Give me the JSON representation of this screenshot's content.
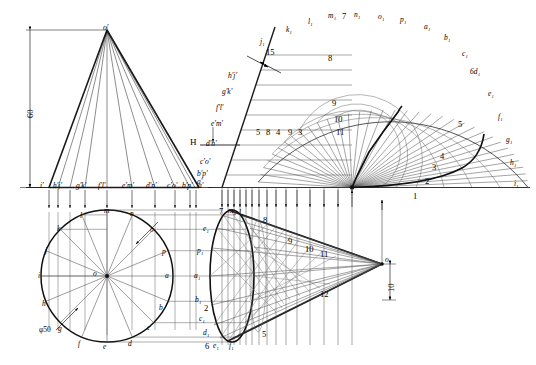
{
  "drawing": {
    "title": "Oblique cone surface development",
    "dimensions": {
      "height_60": "60",
      "diameter_50": "φ50",
      "offset_15": "15",
      "offset_10": "10"
    },
    "plane_label": "H",
    "front_view": {
      "apex": "o'",
      "base_labels": [
        "i'",
        "h'j'",
        "g'k'",
        "f'l'",
        "e'm'",
        "d'n'",
        "c'o'",
        "b'p'",
        "a'"
      ]
    },
    "plan_view": {
      "center": "o",
      "points": [
        "a",
        "b",
        "c",
        "d",
        "e",
        "f",
        "g",
        "h",
        "i",
        "j",
        "k",
        "l",
        "m",
        "n",
        "o",
        "p"
      ]
    },
    "aux_view": {
      "labels": [
        "h'j'",
        "g'k'",
        "f'l'",
        "e'm'",
        "d'n'",
        "c'o'",
        "b'p'",
        "a'"
      ],
      "center_numbers": [
        "5",
        "8",
        "4",
        "9",
        "3"
      ]
    },
    "development": {
      "apex": "o",
      "outer_labels": [
        "j₁",
        "k₁",
        "l₁",
        "m₁",
        "n₁",
        "o₁",
        "p₁",
        "a₁",
        "b₁",
        "c₁",
        "6d₁",
        "e₁",
        "f₁",
        "g₁",
        "h₁",
        "i₁"
      ],
      "inner_numbers": [
        "7",
        "8",
        "9",
        "10",
        "11",
        "1",
        "2",
        "3",
        "4",
        "5"
      ]
    },
    "cone_view": {
      "apex": "o₁",
      "top_labels": [
        "7",
        "m₁",
        "l₁"
      ],
      "side_numbers": [
        "8",
        "9",
        "10",
        "11",
        "12"
      ],
      "left_labels": [
        "e₁",
        "p₁",
        "a₁",
        "b₁",
        "c₁",
        "d₁"
      ],
      "bottom_labels": [
        "6",
        "e₁",
        "f₁",
        "5"
      ],
      "mid_numbers": [
        "2",
        "3",
        "4",
        "5"
      ]
    }
  }
}
